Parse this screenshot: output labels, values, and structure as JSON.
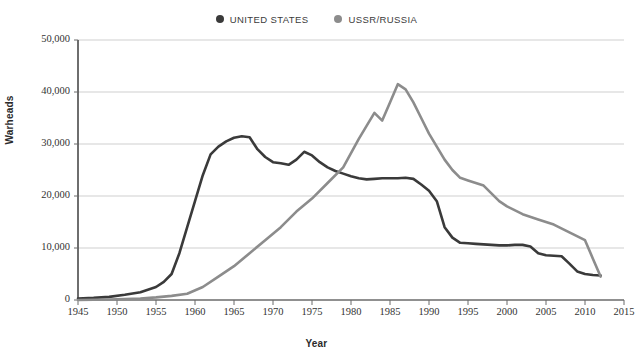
{
  "legend": {
    "position": "top-center",
    "items": [
      {
        "label": "UNITED STATES",
        "color": "#3a3a3a",
        "icon": "legend-dot-icon"
      },
      {
        "label": "USSR/RUSSIA",
        "color": "#8c8c8c",
        "icon": "legend-dot-icon"
      }
    ]
  },
  "axis": {
    "ylabel": "Warheads",
    "xlabel": "Year"
  },
  "chart_data": {
    "type": "line",
    "title": "",
    "subtitle": "",
    "xlabel": "Year",
    "ylabel": "Warheads",
    "xlim": [
      1945,
      2015
    ],
    "ylim": [
      0,
      50000
    ],
    "xticks": [
      1945,
      1950,
      1955,
      1960,
      1965,
      1970,
      1975,
      1980,
      1985,
      1990,
      1995,
      2000,
      2005,
      2010,
      2015
    ],
    "xtick_labels": [
      "1945",
      "1950",
      "1955",
      "1960",
      "1965",
      "1970",
      "1975",
      "1980",
      "1985",
      "1990",
      "1995",
      "2000",
      "2005",
      "2010",
      "2015"
    ],
    "yticks": [
      0,
      10000,
      20000,
      30000,
      40000,
      50000
    ],
    "ytick_labels": [
      "0",
      "10,000",
      "20,000",
      "30,000",
      "40,000",
      "50,000"
    ],
    "grid": "horizontal",
    "legend_position": "top-center",
    "series": [
      {
        "name": "UNITED STATES",
        "color": "#3a3a3a",
        "x": [
          1945,
          1947,
          1949,
          1951,
          1953,
          1955,
          1956,
          1957,
          1958,
          1959,
          1960,
          1961,
          1962,
          1963,
          1964,
          1965,
          1966,
          1967,
          1968,
          1969,
          1970,
          1971,
          1972,
          1973,
          1974,
          1975,
          1976,
          1977,
          1978,
          1979,
          1980,
          1981,
          1982,
          1983,
          1984,
          1985,
          1986,
          1987,
          1988,
          1989,
          1990,
          1991,
          1992,
          1993,
          1994,
          1995,
          1996,
          1997,
          1998,
          1999,
          2000,
          2001,
          2002,
          2003,
          2004,
          2005,
          2006,
          2007,
          2008,
          2009,
          2010,
          2011,
          2012
        ],
        "y": [
          300,
          400,
          600,
          1000,
          1500,
          2500,
          3500,
          5000,
          9000,
          14000,
          19000,
          24000,
          28000,
          29500,
          30500,
          31200,
          31500,
          31300,
          29000,
          27500,
          26500,
          26300,
          26000,
          27000,
          28500,
          27800,
          26500,
          25500,
          24800,
          24300,
          23800,
          23400,
          23200,
          23300,
          23400,
          23400,
          23400,
          23500,
          23300,
          22200,
          21000,
          19000,
          14000,
          12000,
          11000,
          10900,
          10800,
          10700,
          10600,
          10500,
          10500,
          10600,
          10600,
          10300,
          9000,
          8600,
          8500,
          8400,
          7000,
          5500,
          5000,
          4800,
          4700
        ]
      },
      {
        "name": "USSR/RUSSIA",
        "color": "#8c8c8c",
        "x": [
          1945,
          1949,
          1951,
          1953,
          1955,
          1957,
          1959,
          1961,
          1963,
          1965,
          1967,
          1969,
          1971,
          1973,
          1975,
          1977,
          1979,
          1981,
          1982,
          1983,
          1984,
          1985,
          1986,
          1987,
          1988,
          1989,
          1990,
          1991,
          1992,
          1993,
          1994,
          1995,
          1996,
          1997,
          1998,
          1999,
          2000,
          2002,
          2004,
          2006,
          2008,
          2010,
          2011,
          2012
        ],
        "y": [
          0,
          100,
          200,
          300,
          500,
          800,
          1200,
          2500,
          4500,
          6500,
          9000,
          11500,
          14000,
          17000,
          19500,
          22500,
          25500,
          31000,
          33500,
          36000,
          34500,
          38000,
          41500,
          40500,
          38000,
          35000,
          32000,
          29500,
          27000,
          25000,
          23500,
          23000,
          22500,
          22000,
          20500,
          19000,
          18000,
          16500,
          15500,
          14500,
          13000,
          11500,
          8000,
          4500
        ]
      }
    ],
    "annotations": []
  }
}
